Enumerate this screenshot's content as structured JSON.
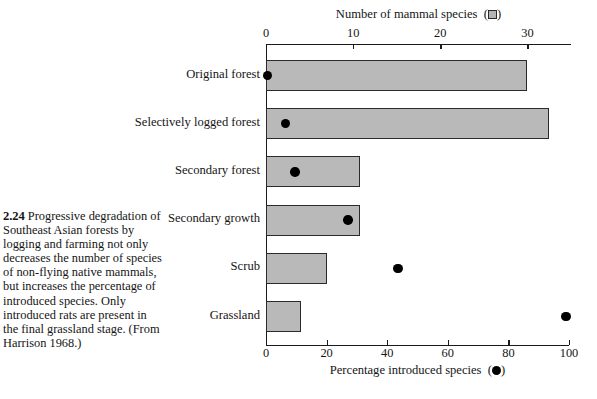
{
  "caption": {
    "figure_number": "2.24",
    "text": "Progressive degradation of Southeast Asian forests by logging and farming not only decreases the number of species of non-flying native mammals, but increases the percentage of introduced species. Only introduced rats are present in the final grassland stage. (From Harrison 1968.)"
  },
  "chart_data": {
    "type": "bar",
    "title": "",
    "orientation": "horizontal",
    "categories": [
      "Original forest",
      "Selectively logged forest",
      "Secondary forest",
      "Secondary growth",
      "Scrub",
      "Grassland"
    ],
    "series": [
      {
        "name": "Number of mammal species",
        "marker": "gray-square",
        "axis": "top",
        "values": [
          30,
          32.5,
          10.8,
          10.8,
          7,
          4
        ]
      },
      {
        "name": "Percentage introduced species",
        "marker": "black-circle",
        "axis": "bottom",
        "values": [
          0.5,
          6.5,
          9.5,
          27,
          43.5,
          99
        ]
      }
    ],
    "top_axis": {
      "label": "Number of mammal species",
      "legend_symbol": "gray-square",
      "ticks": [
        0,
        10,
        20,
        30
      ],
      "tick_labels": [
        "0",
        "10",
        "20",
        "30"
      ],
      "min": 0,
      "max": 35
    },
    "bottom_axis": {
      "label": "Percentage introduced species",
      "legend_symbol": "black-circle",
      "ticks": [
        0,
        20,
        40,
        60,
        80,
        100
      ],
      "tick_labels": [
        "0",
        "20",
        "40",
        "60",
        "80",
        "100"
      ],
      "min": 0,
      "max": 100
    },
    "grid": false,
    "legend_position": "in-axis-titles",
    "colors": {
      "bar_fill": "#b9b9b9",
      "bar_stroke": "#2b2b2b",
      "dot": "#000000",
      "axis": "#1a1a1a",
      "background": "#ffffff"
    }
  }
}
